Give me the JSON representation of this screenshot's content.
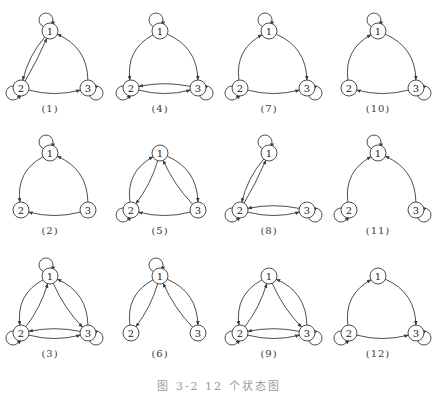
{
  "figure": {
    "caption": "图 3-2  12 个状态图",
    "style": {
      "line_color": "#3a3a3a",
      "node_fill": "#ffffff",
      "background": "#ffffff"
    },
    "node_positions": {
      "1": [
        50,
        31
      ],
      "2": [
        21,
        88
      ],
      "3": [
        88,
        88
      ]
    },
    "panels": [
      {
        "id": 1,
        "label": "(1)",
        "col": 0,
        "row": 0,
        "loops": [
          1,
          2,
          3
        ],
        "edges": [
          [
            "1",
            "2",
            "parallel-outer"
          ],
          [
            "2",
            "1",
            "parallel-inner"
          ],
          [
            "2",
            "3",
            "bottom"
          ],
          [
            "3",
            "1",
            "outer"
          ]
        ]
      },
      {
        "id": 2,
        "label": "(2)",
        "col": 0,
        "row": 1,
        "loops": [
          1
        ],
        "edges": [
          [
            "1",
            "2",
            "outer"
          ],
          [
            "3",
            "2",
            "bottom"
          ],
          [
            "3",
            "1",
            "outer"
          ]
        ]
      },
      {
        "id": 3,
        "label": "(3)",
        "col": 0,
        "row": 2,
        "loops": [
          1,
          2,
          3
        ],
        "edges": [
          [
            "1",
            "2",
            "outer"
          ],
          [
            "2",
            "1",
            "inner"
          ],
          [
            "1",
            "3",
            "inner"
          ],
          [
            "3",
            "1",
            "outer"
          ],
          [
            "2",
            "3",
            "bottom"
          ],
          [
            "3",
            "2",
            "upper"
          ]
        ]
      },
      {
        "id": 4,
        "label": "(4)",
        "col": 1,
        "row": 0,
        "loops": [
          1,
          2,
          3
        ],
        "edges": [
          [
            "1",
            "2",
            "outer"
          ],
          [
            "1",
            "3",
            "outer"
          ],
          [
            "2",
            "3",
            "bottom"
          ],
          [
            "3",
            "2",
            "upper"
          ]
        ]
      },
      {
        "id": 5,
        "label": "(5)",
        "col": 1,
        "row": 1,
        "loops": [
          2
        ],
        "edges": [
          [
            "2",
            "1",
            "outer"
          ],
          [
            "1",
            "2",
            "inner"
          ],
          [
            "1",
            "3",
            "outer"
          ],
          [
            "3",
            "1",
            "inner"
          ],
          [
            "3",
            "2",
            "bottom"
          ]
        ]
      },
      {
        "id": 6,
        "label": "(6)",
        "col": 1,
        "row": 2,
        "loops": [
          1
        ],
        "edges": [
          [
            "2",
            "1",
            "outer-noarrow"
          ],
          [
            "1",
            "2",
            "inner"
          ],
          [
            "1",
            "3",
            "outer"
          ],
          [
            "3",
            "1",
            "inner"
          ]
        ]
      },
      {
        "id": 7,
        "label": "(7)",
        "col": 2,
        "row": 0,
        "loops": [
          1,
          2,
          3
        ],
        "edges": [
          [
            "2",
            "1",
            "outer"
          ],
          [
            "1",
            "3",
            "outer"
          ],
          [
            "2",
            "3",
            "bottom"
          ]
        ]
      },
      {
        "id": 8,
        "label": "(8)",
        "col": 2,
        "row": 1,
        "loops": [
          1,
          2,
          3
        ],
        "edges": [
          [
            "1",
            "2",
            "parallel-outer"
          ],
          [
            "2",
            "1",
            "parallel-inner"
          ],
          [
            "2",
            "3",
            "bottom"
          ],
          [
            "3",
            "2",
            "upper"
          ]
        ]
      },
      {
        "id": 9,
        "label": "(9)",
        "col": 2,
        "row": 2,
        "loops": [
          2,
          3
        ],
        "edges": [
          [
            "1",
            "2",
            "outer"
          ],
          [
            "2",
            "1",
            "inner"
          ],
          [
            "1",
            "3",
            "inner"
          ],
          [
            "3",
            "1",
            "outer"
          ],
          [
            "2",
            "3",
            "bottom"
          ],
          [
            "3",
            "2",
            "upper"
          ]
        ]
      },
      {
        "id": 10,
        "label": "(10)",
        "col": 3,
        "row": 0,
        "loops": [
          1,
          3
        ],
        "edges": [
          [
            "2",
            "1",
            "outer"
          ],
          [
            "1",
            "3",
            "outer"
          ],
          [
            "3",
            "2",
            "bottom"
          ]
        ]
      },
      {
        "id": 11,
        "label": "(11)",
        "col": 3,
        "row": 1,
        "loops": [
          1,
          2,
          3
        ],
        "edges": [
          [
            "2",
            "1",
            "outer"
          ],
          [
            "3",
            "1",
            "outer"
          ]
        ]
      },
      {
        "id": 12,
        "label": "(12)",
        "col": 3,
        "row": 2,
        "loops": [
          2,
          3
        ],
        "edges": [
          [
            "2",
            "1",
            "outer"
          ],
          [
            "1",
            "3",
            "outer"
          ],
          [
            "2",
            "3",
            "bottom"
          ]
        ]
      }
    ],
    "layout": {
      "col_x": [
        0,
        110,
        219,
        328
      ],
      "row_y": [
        0,
        122,
        245
      ]
    }
  }
}
